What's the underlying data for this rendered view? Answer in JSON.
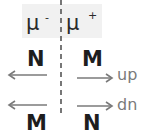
{
  "diagram": {
    "header": {
      "left": {
        "symbol": "μ",
        "charge": "-"
      },
      "right": {
        "symbol": "μ",
        "charge": "+"
      }
    },
    "rows": [
      {
        "name": "up",
        "left_label": "N",
        "left_label_position": "above",
        "right_label": "M",
        "right_label_position": "above",
        "row_label": "up"
      },
      {
        "name": "dn",
        "left_label": "M",
        "left_label_position": "below",
        "right_label": "N",
        "right_label_position": "below",
        "row_label": "dn"
      }
    ],
    "colors": {
      "text": "#1e1e1e",
      "arrow": "#7a7a7a",
      "divider": "#555555",
      "header_bg": "#f1f1f1"
    }
  }
}
